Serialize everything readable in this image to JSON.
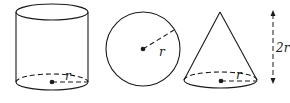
{
  "diagram": {
    "colors": {
      "stroke": "#1a1a1a",
      "background": "#ffffff"
    },
    "shapes": [
      {
        "id": "cylinder",
        "type": "cylinder",
        "radius_label": "r"
      },
      {
        "id": "sphere",
        "type": "sphere",
        "radius_label": "r"
      },
      {
        "id": "cone",
        "type": "cone",
        "radius_label": "r"
      }
    ],
    "height_indicator": {
      "label": "2r"
    }
  }
}
